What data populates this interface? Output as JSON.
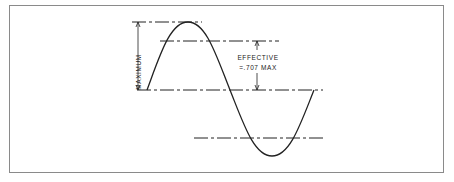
{
  "diagram": {
    "labels": {
      "maximum": "MAXIMUM",
      "effective_line1": "EFFECTIVE",
      "effective_line2": "=.707 MAX"
    },
    "colors": {
      "stroke": "#222222",
      "border": "#8a8a8a",
      "background": "#ffffff"
    }
  }
}
